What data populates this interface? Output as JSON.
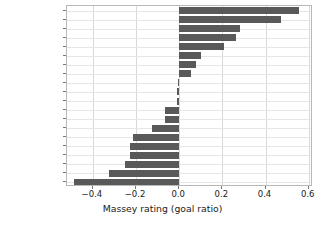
{
  "chart_data": {
    "type": "bar",
    "orientation": "horizontal",
    "title": "",
    "xlabel": "Massey rating (goal ratio)",
    "ylabel": "",
    "xlim": [
      -0.52,
      0.62
    ],
    "xticks": [
      -0.4,
      -0.2,
      0.0,
      0.2,
      0.4,
      0.6
    ],
    "xticklabels": [
      "−0.4",
      "−0.2",
      "0.0",
      "0.2",
      "0.4",
      "0.6"
    ],
    "grid": true,
    "grid_axis": "both",
    "legend": null,
    "bar_color": "#595959",
    "categories": [
      "kawasakif",
      "yokohamafm",
      "kashima",
      "kobe",
      "nagoya",
      "urawa",
      "fukuoka",
      "tosu",
      "hiroshima",
      "ftokyo",
      "cosaka",
      "sapporo",
      "shonan",
      "gosaka",
      "kashiwa",
      "shimizu",
      "tokushima",
      "oita",
      "sendai",
      "yokohamafc"
    ],
    "values": [
      0.553,
      0.472,
      0.282,
      0.262,
      0.206,
      0.101,
      0.079,
      0.055,
      -0.006,
      -0.008,
      -0.012,
      -0.065,
      -0.068,
      -0.126,
      -0.215,
      -0.228,
      -0.228,
      -0.249,
      -0.325,
      -0.487
    ]
  }
}
